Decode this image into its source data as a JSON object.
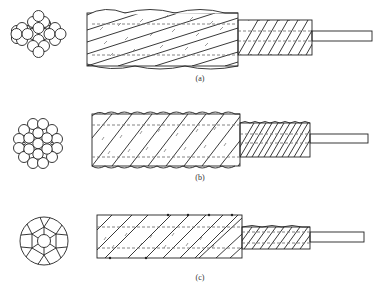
{
  "figure": {
    "panels": [
      {
        "id": "a",
        "label": "(a)",
        "cross_section": "round-wire strand, 19 wires (1 center + 6 inner + 12 outer), hexagonal packing",
        "side_view": "stranded rope with outer lay, intermediate layer, and straight core wire"
      },
      {
        "id": "b",
        "label": "(b)",
        "cross_section": "round-wire strand, 19 wires with filler wires, circular packing",
        "side_view": "stranded rope with tighter lay, intermediate layer, and straight core wire"
      },
      {
        "id": "c",
        "label": "(c)",
        "cross_section": "compacted strand with shaped wires (1 center + 6 inner + 12 outer segments)",
        "side_view": "compacted smooth-surface rope, intermediate layer, and straight core wire"
      }
    ]
  },
  "colors": {
    "stroke": "#222222",
    "dashed": "#666666",
    "background": "#ffffff"
  }
}
